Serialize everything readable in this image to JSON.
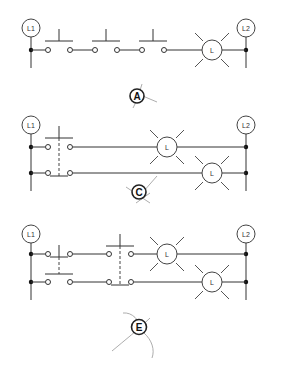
{
  "diagram": {
    "type": "ladder-logic-circuits",
    "circuits": [
      {
        "id": "A",
        "label": "A",
        "rail_left_label": "L1",
        "rail_right_label": "L2",
        "lamp_label": "L",
        "description": "Three normally-open pushbuttons in series with one lamp"
      },
      {
        "id": "C",
        "label": "C",
        "rail_left_label": "L1",
        "rail_right_label": "L2",
        "lamp_labels": [
          "L",
          "L"
        ],
        "description": "One double-pole pushbutton (NO top, NC bottom) each controlling a lamp"
      },
      {
        "id": "E",
        "label": "E",
        "rail_left_label": "L1",
        "rail_right_label": "L2",
        "lamp_labels": [
          "L",
          "L"
        ],
        "description": "Two double-pole pushbuttons in series on two rungs, each rung controlling a lamp"
      }
    ]
  }
}
